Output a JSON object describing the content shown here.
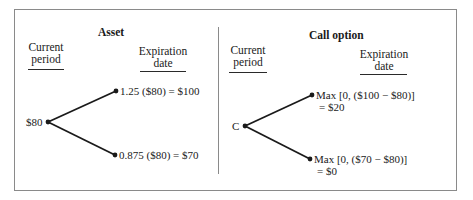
{
  "asset": {
    "title": "Asset",
    "col_current": [
      "Current",
      "period"
    ],
    "col_expiration": [
      "Expiration",
      "date"
    ],
    "root_label": "$80",
    "up_label": "1.25 ($80) = $100",
    "down_label": "0.875 ($80) = $70"
  },
  "call": {
    "title": "Call option",
    "col_current": [
      "Current",
      "period"
    ],
    "col_expiration": [
      "Expiration",
      "date"
    ],
    "root_label": "C",
    "up_label": [
      "Max [0, ($100 − $80)]",
      "= $20"
    ],
    "down_label": [
      "Max [0, ($70 − $80)]",
      "= $0"
    ]
  },
  "colors": {
    "line": "#1a1a1a",
    "frame": "#8a8a8a"
  }
}
